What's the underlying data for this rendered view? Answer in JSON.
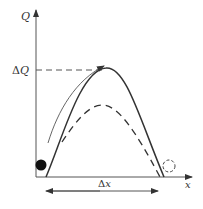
{
  "diagram": {
    "axes": {
      "y_label": "Q",
      "x_label": "x"
    },
    "annotations": {
      "delta_q_label": "ΔQ",
      "delta_q_symbol": "Δ",
      "delta_q_var": "Q",
      "delta_x_symbol": "Δ",
      "delta_x_var": "x"
    },
    "curves": [
      {
        "name": "solid-barrier-curve",
        "style": "solid"
      },
      {
        "name": "dashed-barrier-curve",
        "style": "dashed"
      },
      {
        "name": "motion-arrow-curve",
        "style": "thin-arrow"
      }
    ],
    "objects": [
      {
        "name": "filled-ball",
        "style": "filled"
      },
      {
        "name": "dashed-ball",
        "style": "dashed-outline"
      }
    ],
    "colors": {
      "stroke": "#333333",
      "axis": "#555555",
      "ball": "#111111"
    }
  }
}
